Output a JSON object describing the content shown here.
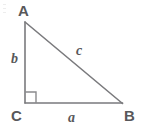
{
  "figure": {
    "name": "right-triangle-diagram",
    "background_color": "#ffffff",
    "stroke_color": "#7a7a7d",
    "label_color": "#58585a",
    "vertices": [
      {
        "id": "A",
        "label": "A",
        "x": 25,
        "y": 22
      },
      {
        "id": "B",
        "label": "B",
        "x": 122,
        "y": 103
      },
      {
        "id": "C",
        "label": "C",
        "x": 25,
        "y": 103
      }
    ],
    "sides": [
      {
        "id": "a",
        "label": "a",
        "from": "C",
        "to": "B",
        "role": "adjacent-leg"
      },
      {
        "id": "b",
        "label": "b",
        "from": "A",
        "to": "C",
        "role": "opposite-leg"
      },
      {
        "id": "c",
        "label": "c",
        "from": "A",
        "to": "B",
        "role": "hypotenuse"
      }
    ],
    "right_angle": {
      "at": "C",
      "marker": "square",
      "size": 11
    },
    "paths": {
      "leg_b": "M 25 22 L 25 103",
      "leg_a": "M 25 103 L 122 103",
      "hypotenuse_c": "M 25 22 L 122 103",
      "right_angle_marker": "M 25 92 L 36 92 L 36 103"
    }
  }
}
